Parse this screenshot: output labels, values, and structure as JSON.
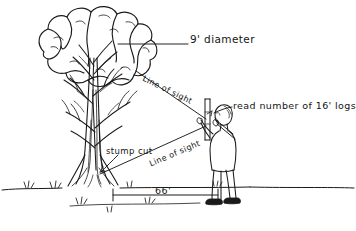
{
  "diagram": {
    "style": "hand-drawn pen sketch",
    "background_color": "#ffffff",
    "ink_color": "#1a1a1a"
  },
  "labels": {
    "diameter": "9' diameter",
    "logs": "read number of 16' logs",
    "line_of_sight_upper": "Line of sight",
    "line_of_sight_lower": "Line of sight",
    "stump_cut": "stump cut",
    "baseline_distance": "66'"
  },
  "objects": {
    "tree": "broadleaf-tree",
    "observer": "standing-person-holding-stick",
    "stick": "measuring-stick",
    "ground": "ground-line-with-grass"
  },
  "measurements": {
    "crown_diameter": "9'",
    "log_length": "16'",
    "baseline": "66'"
  }
}
